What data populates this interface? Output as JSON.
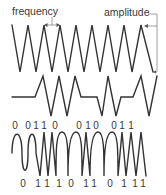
{
  "labels": {
    "frequency": "frequency",
    "amplitude": "amplitude"
  },
  "colors": {
    "wave": "#333333",
    "guide": "#888888",
    "text": "#3a3a3a"
  },
  "waves": {
    "carrier": {
      "name": "carrier-wave",
      "points": [
        [
          12,
          25
        ],
        [
          20,
          72
        ],
        [
          28,
          25
        ],
        [
          36,
          72
        ],
        [
          44,
          25
        ],
        [
          52,
          72
        ],
        [
          60,
          25
        ],
        [
          68,
          72
        ],
        [
          76,
          25
        ],
        [
          84,
          72
        ],
        [
          92,
          25
        ],
        [
          100,
          72
        ],
        [
          108,
          25
        ],
        [
          116,
          72
        ],
        [
          124,
          25
        ],
        [
          132,
          72
        ],
        [
          141,
          25
        ],
        [
          153,
          72
        ]
      ]
    },
    "amplitude_modulated": {
      "name": "amplitude-modulated-wave",
      "points": [
        [
          12,
          97
        ],
        [
          35,
          97
        ],
        [
          43,
          76
        ],
        [
          51,
          116
        ],
        [
          59,
          76
        ],
        [
          67,
          116
        ],
        [
          75,
          76
        ],
        [
          81,
          97
        ],
        [
          97,
          97
        ],
        [
          102,
          116
        ],
        [
          108,
          76
        ],
        [
          116,
          116
        ],
        [
          121,
          97
        ],
        [
          133,
          97
        ],
        [
          141,
          76
        ],
        [
          149,
          116
        ],
        [
          157,
          76
        ]
      ]
    },
    "frequency_modulated": {
      "name": "frequency-modulated-wave",
      "path": "M12,153 C12,128 22,128 22,153 C22,176 28,176 28,153 C28,128 36,128 36,153 L40,176 L44,132 L48,176 L52,132 L56,176 C56,150 56,132 62,132 C68,132 68,150 68,176 C68,150 70,132 76,132 C82,132 82,150 82,176 L86,132 L90,176 C90,150 92,132 98,132 C104,132 104,150 104,176 C104,150 106,132 112,132 C118,132 118,150 118,176 L122,132 L126,176 L131,132 L136,176 L141,132 L146,176"
    }
  },
  "top_bits": [
    {
      "bit": "0",
      "x": 15
    },
    {
      "bit": "0",
      "x": 28
    },
    {
      "bit": "1",
      "x": 36
    },
    {
      "bit": "1",
      "x": 44
    },
    {
      "bit": "0",
      "x": 55
    },
    {
      "bit": "0",
      "x": 79
    },
    {
      "bit": "1",
      "x": 88
    },
    {
      "bit": "0",
      "x": 96
    },
    {
      "bit": "0",
      "x": 114
    },
    {
      "bit": "1",
      "x": 122
    },
    {
      "bit": "1",
      "x": 131
    }
  ],
  "bottom_bits": [
    {
      "bit": "0",
      "x": 23
    },
    {
      "bit": "1",
      "x": 38
    },
    {
      "bit": "1",
      "x": 47
    },
    {
      "bit": "1",
      "x": 59
    },
    {
      "bit": "0",
      "x": 71
    },
    {
      "bit": "1",
      "x": 86
    },
    {
      "bit": "1",
      "x": 94
    },
    {
      "bit": "0",
      "x": 110
    },
    {
      "bit": "1",
      "x": 124
    },
    {
      "bit": "1",
      "x": 135
    },
    {
      "bit": "1",
      "x": 143
    }
  ]
}
